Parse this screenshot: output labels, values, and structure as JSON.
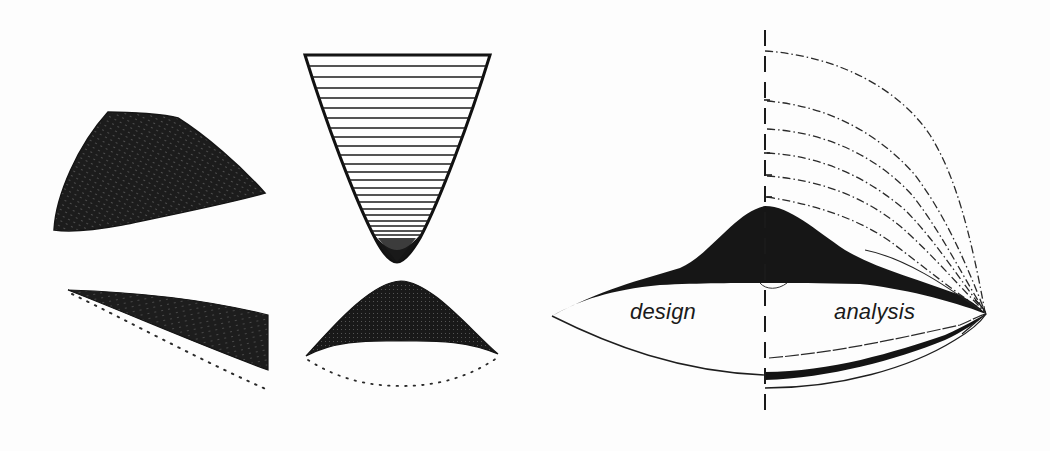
{
  "figure": {
    "colors": {
      "ink": "#1a1a1a",
      "background": "#fdfdfd",
      "mesh_dark": "#222222"
    },
    "panels": [
      {
        "id": "left-top-surface",
        "type": "shaded-mesh-surface"
      },
      {
        "id": "left-bottom-wedge",
        "type": "shaded-mesh-wedge-with-dotted-edge"
      },
      {
        "id": "center-funnel",
        "type": "hatched-inverted-cone"
      },
      {
        "id": "center-dome",
        "type": "shaded-dome-with-dotted-base"
      },
      {
        "id": "right-lens-diagram",
        "type": "design-analysis-diagram"
      }
    ],
    "labels": {
      "design": "design",
      "analysis": "analysis"
    }
  }
}
